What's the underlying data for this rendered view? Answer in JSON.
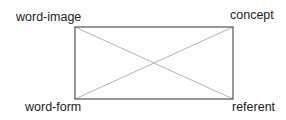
{
  "diagram": {
    "type": "semiotic-rectangle",
    "corners": {
      "top_left": "word-image",
      "top_right": "concept",
      "bottom_left": "word-form",
      "bottom_right": "referent"
    },
    "edges": [
      {
        "from": "word-image",
        "to": "concept",
        "style": "solid"
      },
      {
        "from": "concept",
        "to": "referent",
        "style": "solid"
      },
      {
        "from": "referent",
        "to": "word-form",
        "style": "solid"
      },
      {
        "from": "word-form",
        "to": "word-image",
        "style": "solid"
      },
      {
        "from": "word-image",
        "to": "referent",
        "style": "diagonal"
      },
      {
        "from": "concept",
        "to": "word-form",
        "style": "diagonal"
      }
    ],
    "colors": {
      "border": "#555555",
      "diagonal": "#aaaaaa",
      "text": "#222222",
      "background": "#ffffff"
    }
  }
}
